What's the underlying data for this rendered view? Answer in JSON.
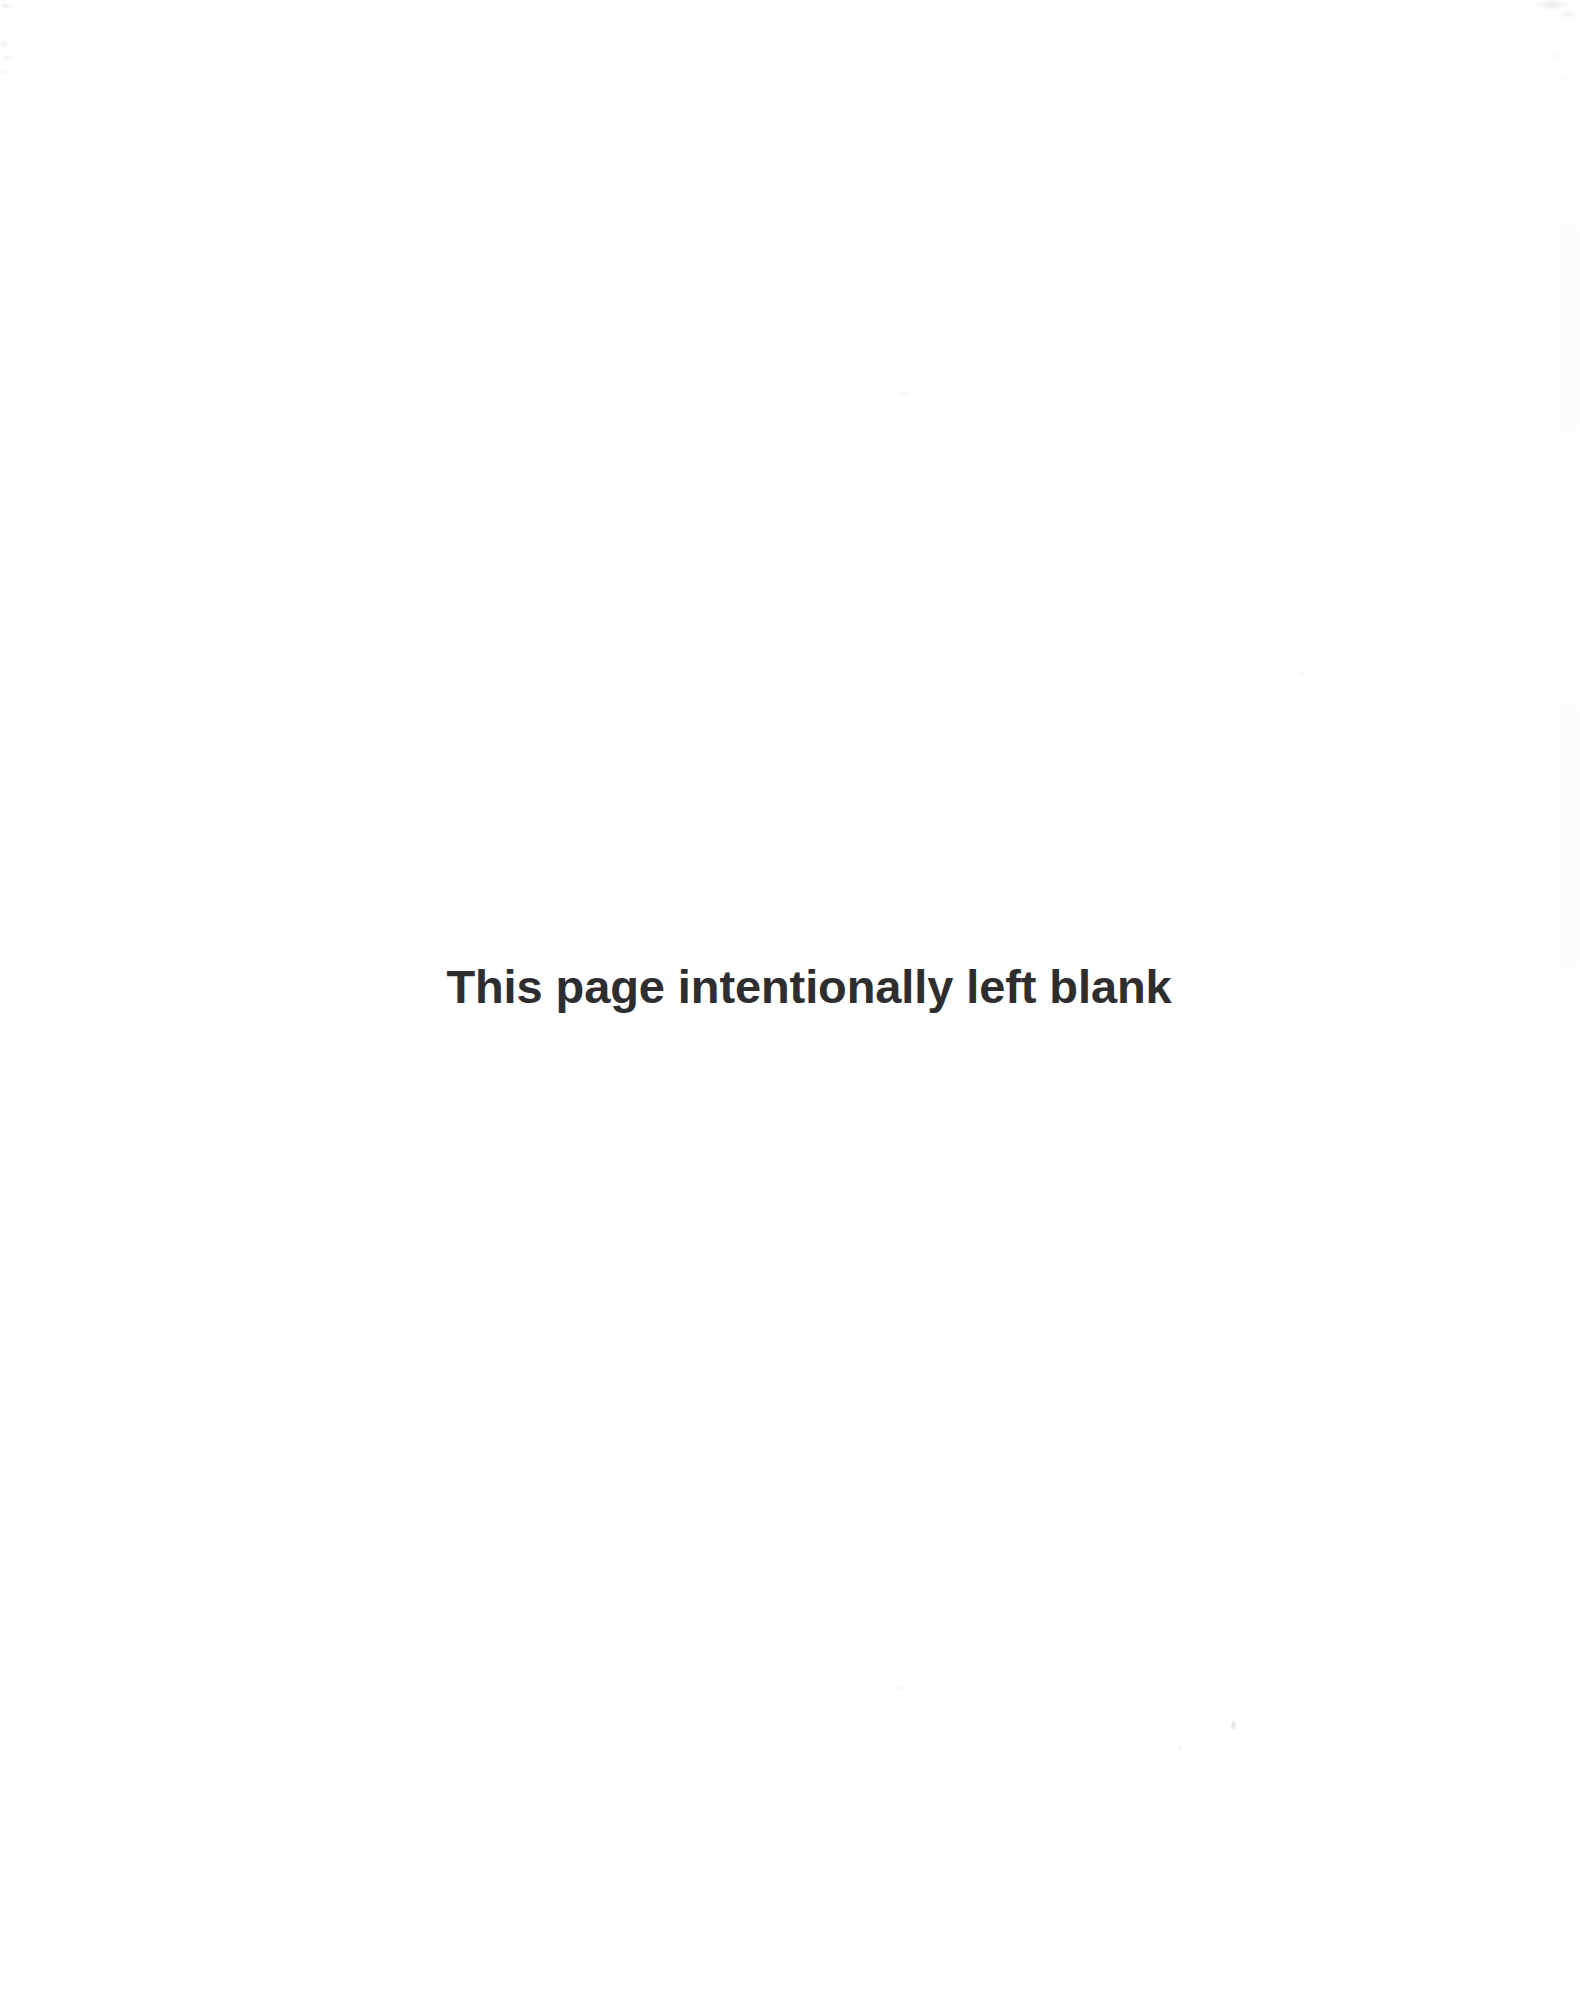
{
  "document": {
    "page_kind": "intentionally-blank-filler-page",
    "background_color": "#ffffff",
    "notice": {
      "text": "This page intentionally left blank",
      "color": "#2e2e30",
      "weight": "bold",
      "alignment": "center"
    },
    "body_content": "",
    "header_text": "",
    "footer_text": "",
    "page_number": ""
  }
}
